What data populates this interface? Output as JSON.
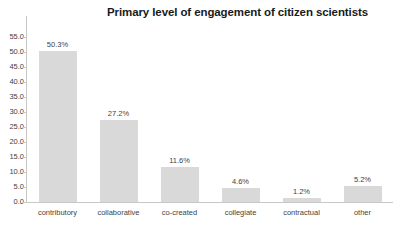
{
  "chart_data": {
    "type": "bar",
    "title": "Primary level of engagement of citizen scientists",
    "xlabel": "",
    "ylabel": "",
    "ylim": [
      0.0,
      55.0
    ],
    "ytick_step": 5.0,
    "grid": false,
    "legend": null,
    "bar_color": "#d9d9d9",
    "axis_color": "#c8c8c8",
    "text_color": "#3f3f3f",
    "title_color": "#1a1a1a",
    "categories": [
      "contributory",
      "collaborative",
      "co-created",
      "collegiate",
      "contractual",
      "other"
    ],
    "values": [
      50.3,
      27.2,
      11.6,
      4.6,
      1.2,
      5.2
    ],
    "data_labels": [
      "50.3%",
      "27.2%",
      "11.6%",
      "4.6%",
      "1.2%",
      "5.2%"
    ],
    "ytick_labels": [
      "55.0",
      "50.0",
      "45.0",
      "40.0",
      "35.0",
      "30.0",
      "25.0",
      "20.0",
      "15.0",
      "10.0",
      "5.0",
      "0.0"
    ],
    "ytick_values": [
      55.0,
      50.0,
      45.0,
      40.0,
      35.0,
      30.0,
      25.0,
      20.0,
      15.0,
      10.0,
      5.0,
      0.0
    ]
  }
}
